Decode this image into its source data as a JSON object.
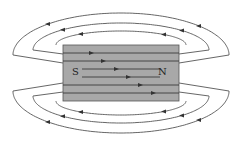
{
  "magnet": {
    "x": 63,
    "y": 45,
    "width": 116,
    "height": 56,
    "fill": "#a8a8a8",
    "south_label": "S",
    "north_label": "N",
    "south_pos": [
      76,
      75
    ],
    "north_pos": [
      162,
      75
    ]
  },
  "inner_lines": [
    {
      "y": 53,
      "x1": 63,
      "x2": 179,
      "arrow_x": 91
    },
    {
      "y": 61,
      "x1": 63,
      "x2": 179,
      "arrow_x": 103
    },
    {
      "y": 69,
      "x1": 82,
      "x2": 160,
      "arrow_x": 116
    },
    {
      "y": 77,
      "x1": 82,
      "x2": 160,
      "arrow_x": 128
    },
    {
      "y": 85,
      "x1": 63,
      "x2": 179,
      "arrow_x": 140
    },
    {
      "y": 93,
      "x1": 63,
      "x2": 179,
      "arrow_x": 153
    }
  ],
  "outer_loops": [
    {
      "position": "top",
      "level": 1,
      "cx": 121,
      "cy": 45,
      "rx": 65,
      "ry": 14,
      "arrows_x": [
        81,
        164
      ],
      "direction": "left"
    },
    {
      "position": "top",
      "level": 2,
      "cx": 121,
      "cy": 50,
      "rx": 88,
      "ry": 27,
      "arrows_x": [
        63,
        182
      ],
      "direction": "left"
    },
    {
      "position": "top",
      "level": 3,
      "cx": 121,
      "cy": 55,
      "rx": 108,
      "ry": 42,
      "arrows_x": [
        48,
        199
      ],
      "direction": "left"
    },
    {
      "position": "bottom",
      "level": 1,
      "cx": 121,
      "cy": 101,
      "rx": 65,
      "ry": 14,
      "arrows_x": [
        81,
        164
      ],
      "direction": "left"
    },
    {
      "position": "bottom",
      "level": 2,
      "cx": 121,
      "cy": 96,
      "rx": 88,
      "ry": 27,
      "arrows_x": [
        63,
        182
      ],
      "direction": "left"
    },
    {
      "position": "bottom",
      "level": 3,
      "cx": 121,
      "cy": 91,
      "rx": 108,
      "ry": 42,
      "arrows_x": [
        48,
        199
      ],
      "direction": "left"
    }
  ],
  "colors": {
    "line": "#555555",
    "arrow": "#333333",
    "magnet": "#a8a8a8",
    "background": "#ffffff"
  }
}
